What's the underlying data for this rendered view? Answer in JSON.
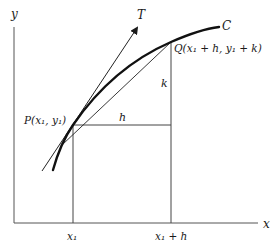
{
  "diagram": {
    "axes": {
      "x_label": "x",
      "y_label": "y"
    },
    "curve": {
      "label": "C"
    },
    "tangent": {
      "label": "T"
    },
    "points": {
      "P": {
        "label": "P(x₁, y₁)"
      },
      "Q": {
        "label": "Q(x₁ + h, y₁ + k)"
      }
    },
    "increments": {
      "h": "h",
      "k": "k"
    },
    "ticks": {
      "x1": "x₁",
      "x1_plus_h": "x₁ + h"
    },
    "colors": {
      "ink": "#1a1a1a",
      "axis": "#555555",
      "background": "#ffffff"
    }
  }
}
